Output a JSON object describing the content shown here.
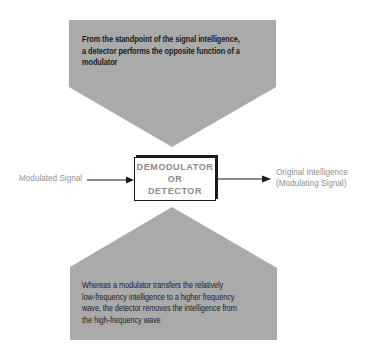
{
  "diagram": {
    "top_note": {
      "lines": [
        "From the standpoint of the signal intelligence,",
        "a detector performs the opposite function of a",
        "modulator"
      ]
    },
    "bottom_note": {
      "lines": [
        "Whereas a modulator transfers the relatively",
        "low-frequency intelligence to a higher frequency",
        "wave, the detector removes the intelligence from",
        "the high-frequency wave"
      ]
    },
    "block": {
      "lines": [
        "DEMODULATOR",
        "OR",
        "DETECTOR"
      ]
    },
    "input_label": "Modulated Signal",
    "output_label": {
      "lines": [
        "Original Intelligence",
        "(Modulating Signal)"
      ]
    },
    "colors": {
      "callout_fill": "#aaaaaa",
      "line": "#1a1a1a",
      "label_text": "#8f8f8f",
      "block_text": "#8a8a8a"
    }
  }
}
